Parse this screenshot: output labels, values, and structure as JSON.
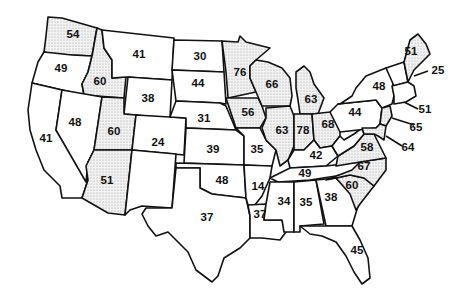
{
  "map": {
    "title": "",
    "shading": {
      "shaded_fill": "#d9d9d9",
      "plain_fill": "#ffffff",
      "rule": "stippled states have values of 50 or higher"
    },
    "states": [
      {
        "id": "WA",
        "value": "54",
        "shaded": true
      },
      {
        "id": "OR",
        "value": "49",
        "shaded": false
      },
      {
        "id": "CA",
        "value": "41",
        "shaded": false
      },
      {
        "id": "ID",
        "value": "60",
        "shaded": true
      },
      {
        "id": "NV",
        "value": "48",
        "shaded": false
      },
      {
        "id": "MT",
        "value": "41",
        "shaded": false
      },
      {
        "id": "WY",
        "value": "38",
        "shaded": false
      },
      {
        "id": "UT",
        "value": "60",
        "shaded": true
      },
      {
        "id": "AZ",
        "value": "51",
        "shaded": true
      },
      {
        "id": "CO",
        "value": "24",
        "shaded": false
      },
      {
        "id": "NM",
        "value": "",
        "shaded": false
      },
      {
        "id": "ND",
        "value": "30",
        "shaded": false
      },
      {
        "id": "SD",
        "value": "44",
        "shaded": false
      },
      {
        "id": "NE",
        "value": "31",
        "shaded": false
      },
      {
        "id": "KS",
        "value": "39",
        "shaded": false
      },
      {
        "id": "OK",
        "value": "48",
        "shaded": false
      },
      {
        "id": "TX",
        "value": "37",
        "shaded": false
      },
      {
        "id": "MN",
        "value": "76",
        "shaded": true
      },
      {
        "id": "IA",
        "value": "56",
        "shaded": true
      },
      {
        "id": "MO",
        "value": "35",
        "shaded": false
      },
      {
        "id": "AR",
        "value": "14",
        "shaded": false
      },
      {
        "id": "LA",
        "value": "37",
        "shaded": false
      },
      {
        "id": "WI",
        "value": "66",
        "shaded": true
      },
      {
        "id": "IL",
        "value": "63",
        "shaded": true
      },
      {
        "id": "MI",
        "value": "63",
        "shaded": true
      },
      {
        "id": "IN",
        "value": "78",
        "shaded": true
      },
      {
        "id": "OH",
        "value": "68",
        "shaded": true
      },
      {
        "id": "KY",
        "value": "42",
        "shaded": false
      },
      {
        "id": "TN",
        "value": "49",
        "shaded": false
      },
      {
        "id": "MS",
        "value": "34",
        "shaded": false
      },
      {
        "id": "AL",
        "value": "35",
        "shaded": false
      },
      {
        "id": "GA",
        "value": "38",
        "shaded": false
      },
      {
        "id": "FL",
        "value": "45",
        "shaded": false
      },
      {
        "id": "SC",
        "value": "60",
        "shaded": true
      },
      {
        "id": "NC",
        "value": "67",
        "shaded": true
      },
      {
        "id": "VA",
        "value": "58",
        "shaded": true
      },
      {
        "id": "WV",
        "value": "",
        "shaded": false
      },
      {
        "id": "PA",
        "value": "44",
        "shaded": false
      },
      {
        "id": "NY",
        "value": "48",
        "shaded": false
      },
      {
        "id": "ME",
        "value": "51",
        "shaded": true
      },
      {
        "id": "NH",
        "value": "25",
        "shaded": false
      },
      {
        "id": "MA_CT",
        "value": "51",
        "shaded": false
      },
      {
        "id": "NJ",
        "value": "65",
        "shaded": true
      },
      {
        "id": "MD_DE",
        "value": "64",
        "shaded": true
      }
    ],
    "labels": {
      "WA": "54",
      "OR": "49",
      "CA": "41",
      "ID": "60",
      "NV": "48",
      "MT": "41",
      "WY": "38",
      "UT": "60",
      "AZ": "51",
      "CO": "24",
      "ND": "30",
      "SD": "44",
      "NE": "31",
      "KS": "39",
      "OK": "48",
      "TX": "37",
      "MN": "76",
      "IA": "56",
      "MO": "35",
      "AR": "14",
      "LA": "37",
      "WI": "66",
      "IL": "63",
      "MI": "63",
      "IN": "78",
      "OH": "68",
      "KY": "42",
      "TN": "49",
      "MS": "34",
      "AL": "35",
      "GA": "38",
      "FL": "45",
      "SC": "60",
      "NC": "67",
      "VA": "58",
      "PA": "44",
      "NY": "48",
      "ME": "51",
      "NH": "25",
      "MA": "51",
      "NJ": "65",
      "MD": "64"
    }
  }
}
